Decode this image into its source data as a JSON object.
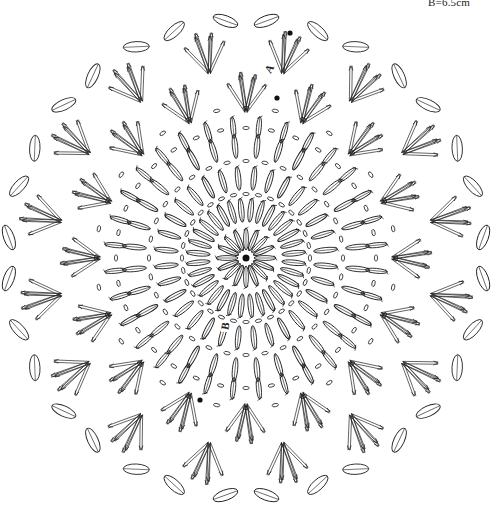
{
  "diagram": {
    "type": "crochet-doily-chart",
    "center": {
      "x": 246,
      "y": 258
    },
    "measurement_label": "B=6.5cm",
    "markers": [
      {
        "label": "A",
        "x": 270,
        "y": 72,
        "rotate": -60
      },
      {
        "label": "B",
        "x": 226,
        "y": 329,
        "rotate": -80
      }
    ],
    "start_dots": [
      {
        "x": 290,
        "y": 33
      },
      {
        "x": 277,
        "y": 98
      },
      {
        "x": 200,
        "y": 400
      }
    ],
    "rings": [
      {
        "name": "center-ring",
        "stitch": "double-crochet",
        "count": 16,
        "r_inner": 8,
        "r_outer": 30
      },
      {
        "name": "ring-2",
        "stitch": "double-crochet",
        "count": 32,
        "r_inner": 36,
        "r_outer": 60
      },
      {
        "name": "ring-2-chain",
        "stitch": "chain",
        "count": 32,
        "radius": 64
      },
      {
        "name": "ring-3",
        "stitch": "double-crochet",
        "count": 32,
        "r_inner": 68,
        "r_outer": 92
      },
      {
        "name": "ring-3-chain",
        "stitch": "chain",
        "count": 32,
        "radius": 97
      },
      {
        "name": "ring-4",
        "stitch": "double-crochet",
        "count": 32,
        "r_inner": 100,
        "r_outer": 124
      },
      {
        "name": "ring-4-chain",
        "stitch": "chain",
        "count": 32,
        "radius": 130
      },
      {
        "name": "ring-5",
        "stitch": "double-crochet",
        "count": 32,
        "r_inner": 120,
        "r_outer": 142
      },
      {
        "name": "ring-5-chain",
        "stitch": "chain",
        "count": 32,
        "radius": 150
      }
    ],
    "fan_rings": [
      {
        "name": "fan-ring-inner",
        "count": 16,
        "radius": 162,
        "length": 40,
        "offset": 0
      },
      {
        "name": "fan-ring-outer",
        "count": 16,
        "radius": 205,
        "length": 42,
        "offset": 0.5
      }
    ],
    "picot_ring": {
      "name": "outer-petal-ring",
      "count": 16,
      "radius": 238,
      "petal_length": 26,
      "offset": 0.5
    }
  }
}
